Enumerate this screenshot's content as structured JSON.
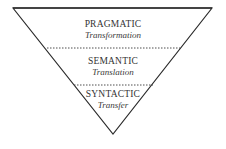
{
  "diagram": {
    "type": "inverted-triangle-levels",
    "colors": {
      "stroke": "#2a2a2a",
      "background": "#ffffff",
      "text": "#333333"
    },
    "levels": [
      {
        "name": "PRAGMATIC",
        "subtitle": "Transformation"
      },
      {
        "name": "SEMANTIC",
        "subtitle": "Translation"
      },
      {
        "name": "SYNTACTIC",
        "subtitle": "Transfer"
      }
    ]
  }
}
